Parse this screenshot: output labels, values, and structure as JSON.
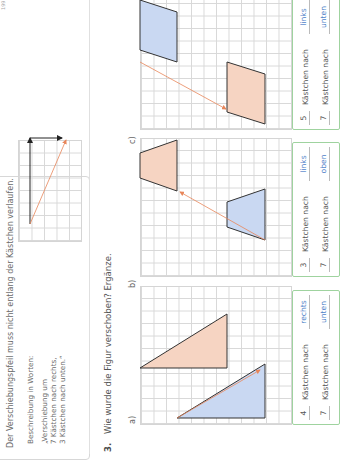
{
  "page_number": "199",
  "info": {
    "heading": "Der Verschiebungspfeil muss nicht entlang der Kästchen verlaufen.",
    "description_label": "Beschreibung in Worten:",
    "quote_lines": "„Verschiebung um\n7 Kästchen nach rechts,\n3 Kästchen nach unten.“"
  },
  "task": {
    "number": "3.",
    "question": "Wie wurde die Figur verschoben? Ergänze."
  },
  "parts": [
    {
      "label": "a)",
      "answers": [
        {
          "count": "4",
          "text": "Kästchen nach",
          "direction": "rechts"
        },
        {
          "count": "7",
          "text": "Kästchen nach",
          "direction": "unten"
        }
      ]
    },
    {
      "label": "b)",
      "answers": [
        {
          "count": "3",
          "text": "Kästchen nach",
          "direction": "links"
        },
        {
          "count": "7",
          "text": "Kästchen nach",
          "direction": "oben"
        }
      ]
    },
    {
      "label": "c)",
      "answers": [
        {
          "count": "5",
          "text": "Kästchen nach",
          "direction": "links"
        },
        {
          "count": "7",
          "text": "Kästchen nach",
          "direction": "unten"
        }
      ]
    }
  ],
  "colors": {
    "original_fill": "#c9d8f2",
    "image_fill": "#f6d4c2",
    "arrow": "#e8865a",
    "answer_border": "#9fd39f",
    "answer_text": "#4f7fc8"
  }
}
